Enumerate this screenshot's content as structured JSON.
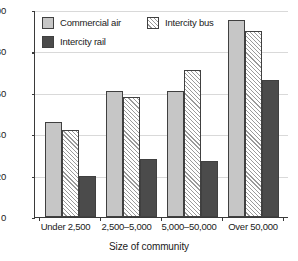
{
  "chart_data": {
    "type": "bar",
    "title": "",
    "xlabel": "Size of community",
    "ylabel": "",
    "categories": [
      "Under 2,500",
      "2,500–5,000",
      "5,000–50,000",
      "Over 50,000"
    ],
    "series": [
      {
        "name": "Commercial air",
        "values": [
          46,
          61,
          61,
          95
        ],
        "color": "#c6c6c6",
        "pattern": "solid-light"
      },
      {
        "name": "Intercity bus",
        "values": [
          42,
          58,
          71,
          90
        ],
        "color": "#ffffff",
        "pattern": "diagonal-hatch"
      },
      {
        "name": "Intercity rail",
        "values": [
          20,
          28,
          27,
          66
        ],
        "color": "#4b4b4b",
        "pattern": "solid-dark"
      }
    ],
    "ylim": [
      0,
      100
    ],
    "yticks": [
      0,
      20,
      40,
      60,
      80,
      100
    ],
    "ytick_labels": [
      "0",
      "20",
      "40",
      "60",
      "80",
      "100"
    ],
    "grid": true,
    "grid_axis": "y",
    "legend_position": "upper-left-inside"
  },
  "legend": {
    "items": [
      {
        "label": "Commercial air",
        "swatch": "light-gray-square-icon"
      },
      {
        "label": "Intercity bus",
        "swatch": "hatched-square-icon"
      },
      {
        "label": "Intercity rail",
        "swatch": "dark-gray-square-icon"
      }
    ]
  },
  "axes": {
    "x_title": "Size of community"
  }
}
